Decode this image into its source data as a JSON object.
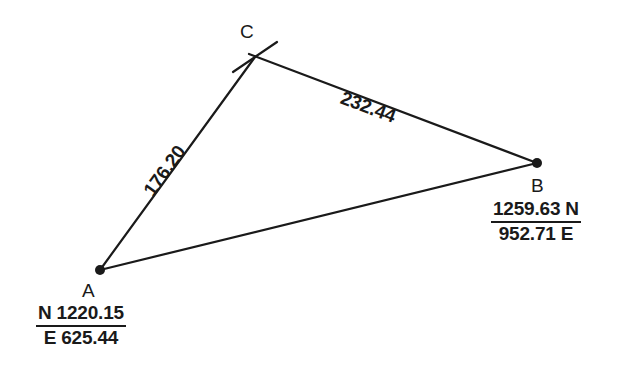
{
  "diagram": {
    "type": "survey-traverse-triangle",
    "background_color": "#ffffff",
    "line_color": "#1a1a1a",
    "text_color": "#1a1a1a"
  },
  "vertices": [
    {
      "id": "A",
      "label": "A",
      "marker": "filled-dot",
      "x": 100,
      "y": 270,
      "coordinate_label": {
        "top": "N 1220.15",
        "bottom": "E 625.44",
        "northing": "1220.15",
        "easting": "625.44",
        "format": "prefix"
      }
    },
    {
      "id": "B",
      "label": "B",
      "marker": "filled-dot",
      "x": 537,
      "y": 163,
      "coordinate_label": {
        "top": "1259.63 N",
        "bottom": "952.71 E",
        "northing": "1259.63",
        "easting": "952.71",
        "format": "suffix"
      }
    },
    {
      "id": "C",
      "label": "C",
      "marker": "tick-cross",
      "x": 255,
      "y": 57,
      "coordinate_label": null
    }
  ],
  "sides": [
    {
      "id": "CB",
      "from": "C",
      "to": "B",
      "distance_label": "232.44",
      "distance": 232.44,
      "angle_deg": 20.6
    },
    {
      "id": "AC",
      "from": "A",
      "to": "C",
      "distance_label": "176.20",
      "distance": 176.2,
      "angle_deg": -54.0
    },
    {
      "id": "AB",
      "from": "A",
      "to": "B",
      "distance_label": "",
      "distance": null,
      "angle_deg": -13.8
    }
  ]
}
